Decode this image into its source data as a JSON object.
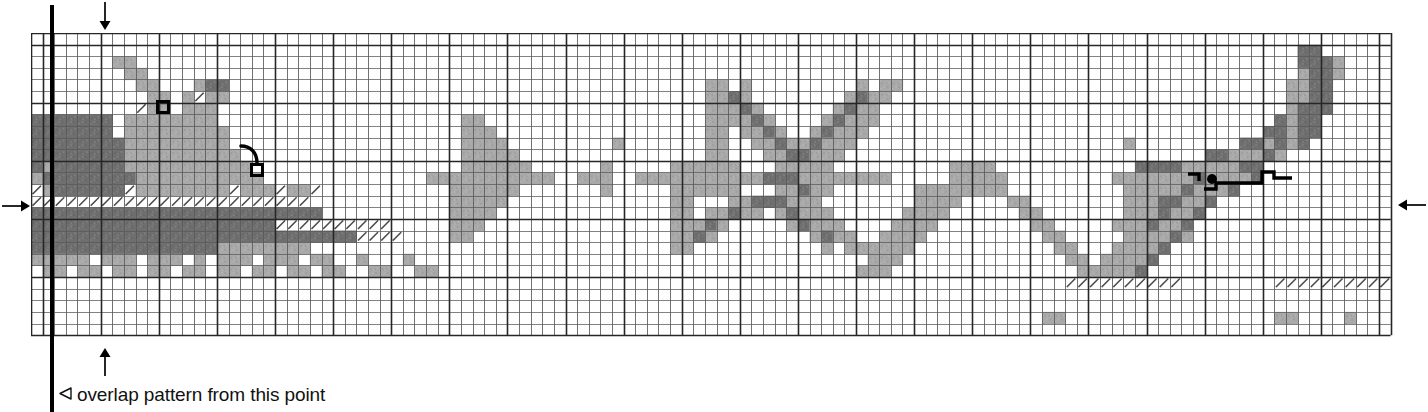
{
  "document": {
    "kind": "knitting-chart",
    "caption": {
      "marker_glyph": "◁",
      "text": "overlap pattern from this point"
    }
  },
  "colors": {
    "background": "#ffffff",
    "cell_dark": "#6f6f6f",
    "cell_light": "#a9a9a9",
    "cell_empty": "#ffffff",
    "grid_thin": "#5a5a5a",
    "grid_thick": "#262626",
    "marker_black": "#000000",
    "caption_text": "#111111"
  },
  "grid": {
    "cols": 117,
    "rows": 26,
    "cell_px": 11.62,
    "origin_x": 31,
    "origin_y": 33,
    "heavy_every": 5,
    "heavy_offset_col": 1,
    "heavy_offset_row": 1,
    "legend": {
      "0": "empty",
      "1": "light-gray",
      "2": "dark-gray",
      "3": "white-with-diagonal-slash",
      "4": "light-gray-with-diagonal-slash",
      "5": "dark-gray-with-diagonal-slash"
    }
  },
  "arrows": [
    {
      "name": "top-arrow",
      "direction": "down",
      "x": 97,
      "y": 2,
      "length": 28
    },
    {
      "name": "bottom-arrow",
      "direction": "up",
      "x": 97,
      "y": 348,
      "length": 28
    },
    {
      "name": "left-arrow",
      "direction": "right",
      "x": 2,
      "y": 198,
      "length": 28
    },
    {
      "name": "right-arrow",
      "direction": "left",
      "x": 1398,
      "y": 197,
      "length": 28
    }
  ],
  "repeat_line": {
    "name": "overlap-start-line",
    "x": 50,
    "y_top": 5,
    "y_bottom": 412,
    "width": 4
  },
  "annotations": [
    {
      "name": "stitch-marker-square-upper",
      "type": "square",
      "x": 156,
      "y": 100,
      "size": 14
    },
    {
      "name": "stitch-marker-square-lower",
      "type": "square",
      "x": 250,
      "y": 163,
      "size": 14
    },
    {
      "name": "stitch-link-curve-left",
      "type": "curve"
    },
    {
      "name": "stitch-marker-dot-right",
      "type": "dot",
      "x": 1212,
      "y": 179,
      "radius": 5
    },
    {
      "name": "stitch-step-line-right",
      "type": "steps"
    },
    {
      "name": "stitch-hook-left-right",
      "type": "hook"
    }
  ],
  "chart_rows": [
    "000000000000000000000000000000000000000000000000000000000000000000000000000000000000000000000000000000000000000000000",
    "000000000000000000000000000000000000000000000000000000000000000000000000000000000000000000000000000000000000022000000",
    "000000011000000000000000000000000000000000000000000000000000000000000000000000000000000000000000000000000000022210000",
    "000000001100000000000000000000000000000000000000000000000000000000000000000000000000000000000000000000000000012210000",
    "000000000110001220000000000000000000000000000000000000000011010000000001011000000000000000000000000000000000112200000",
    "000000000011013110000000000000000000000000000000000000000011210000000012110000000000000000000000000000000000112200000",
    "000000000S11011100000000000000000000000000000000000000000011121000000121100000000000000000000000000000000000122200000",
    "222222201111111100000000000000000000011000000000000000000011112100001211100000000000000000000000000000000002122000000",
    "222222201111111110000000000000000000011100000000000000000011011210012111000000000000000000000000000000000022122000000",
    "222222221111111110000000000000000000011110000000001000000011001121121110000000000000000000000010000000002212120000000",
    "222222221111111111000000000000000000011111000000000000000011000112211100000000000000000000000000000002211121000000000",
    "212222221111111111100000000000000000011111100000010000011111100011111000000000011110000000000002222111112200000000000",
    "122222222111111111110000000000000011111111111001110011111111111222111111110000011111000000000111111121111200000000000",
    "312222223111111113111311300000000000111111000000010000011111100011211000000011111111000000000011111211120000000000000",
    "333333333333333333333333000000000000111110000000000000011000112221110000000011110000110000000011122112000000000000000",
    "222222222222222222222222200000000000111100000000000000011011211012111000000111100000011000000011121120000000000000000",
    "222222222222222222222333333333300000111000000000000000011121000001211100001111000000001100000111211200000000000000000",
    "222222222222222222222222222233330000110000000000000000011210000000012110011110000000000110000011112100000000000000000",
    "222222222222222211111111000000000000000000000000000000011000000000001011111100000000000011000111120000000000000000000",
    "111110111011101011101110110010001000000000000000000000000000000000000000111000000000000001101111200000000000000000000",
    "011011011011011011011011011001100110000000000000000000000000000000000001110000000000000000111112000000000000000000000",
    "000000000000000000000000000000000000000000000000000000000000000000000000000000000000000003333333333000000003333333333",
    "000000000000000000000000000000000000000000000000000000000000000000000000000000000000000000000000000000000000000000000",
    "000000000000000000000000000000000000000000000000000000000000000000000000000000000000000000000000000000000000000000000",
    "000000000000000000000000000000000000000000000000000000000000000000000000000000000000000110000000000000000001100001000",
    "000000000000000000000000000000000000000000000000000000000000000000000000000000000000000000000000000000000000000000000"
  ]
}
